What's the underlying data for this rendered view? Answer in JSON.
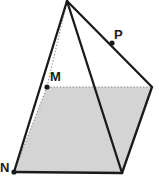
{
  "figure": {
    "type": "line-diagram",
    "width": 159,
    "height": 180,
    "background_color": "#ffffff",
    "stroke_color": "#1a1a1a",
    "dotted_stroke_color": "#8c8c8c",
    "face_fill_color": "#d4d4d4",
    "point_marker_color": "#1a1a1a",
    "labels": [
      {
        "name": "M",
        "text": "M",
        "x": 50,
        "y": 70
      },
      {
        "name": "P",
        "text": "P",
        "x": 114,
        "y": 28
      },
      {
        "name": "N",
        "text": "N",
        "x": 0,
        "y": 161
      }
    ],
    "points": [
      {
        "name": "apex",
        "x": 67,
        "y": 1
      },
      {
        "name": "M",
        "x": 47,
        "y": 87
      },
      {
        "name": "P",
        "x": 112,
        "y": 43
      },
      {
        "name": "N",
        "x": 14,
        "y": 172
      },
      {
        "name": "right-top",
        "x": 152,
        "y": 87
      },
      {
        "name": "bottom-right",
        "x": 122,
        "y": 173
      }
    ],
    "marked_points": [
      {
        "name": "point-M",
        "x": 47,
        "y": 87
      },
      {
        "name": "point-P",
        "x": 112,
        "y": 43
      },
      {
        "name": "point-N",
        "x": 14,
        "y": 172
      }
    ],
    "shaded_face": {
      "name": "shaded-parallelogram",
      "polygon": "47,87 152,87 122,173 14,172"
    },
    "solid_edges": [
      {
        "name": "edge-apex-to-N",
        "x1": 67,
        "y1": 1,
        "x2": 14,
        "y2": 172
      },
      {
        "name": "edge-apex-to-right-top",
        "x1": 67,
        "y1": 1,
        "x2": 152,
        "y2": 87
      },
      {
        "name": "edge-apex-to-bottom-right",
        "x1": 67,
        "y1": 1,
        "x2": 122,
        "y2": 173
      },
      {
        "name": "edge-right-top-to-bottom-right",
        "x1": 152,
        "y1": 87,
        "x2": 122,
        "y2": 173
      },
      {
        "name": "edge-N-to-bottom-right",
        "x1": 14,
        "y1": 172,
        "x2": 122,
        "y2": 173
      }
    ],
    "dotted_edges": [
      {
        "name": "hidden-edge-M-to-right-top",
        "x1": 47,
        "y1": 87,
        "x2": 152,
        "y2": 87
      },
      {
        "name": "hidden-edge-M-to-N",
        "x1": 47,
        "y1": 87,
        "x2": 14,
        "y2": 172
      },
      {
        "name": "hidden-edge-apex-to-M",
        "x1": 67,
        "y1": 1,
        "x2": 47,
        "y2": 87
      }
    ]
  }
}
